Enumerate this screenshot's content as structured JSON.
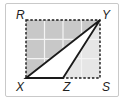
{
  "diagram": {
    "type": "geometry-figure",
    "points": {
      "R": {
        "label": "R",
        "x": 26,
        "y": 20
      },
      "Y": {
        "label": "Y",
        "x": 100,
        "y": 20
      },
      "S": {
        "label": "S",
        "x": 100,
        "y": 78
      },
      "X": {
        "label": "X",
        "x": 26,
        "y": 78
      },
      "Z": {
        "label": "Z",
        "x": 63,
        "y": 78
      }
    },
    "grid": {
      "columns": 4,
      "rows": 3
    },
    "rectangle": {
      "vertices": [
        "R",
        "Y",
        "S",
        "X"
      ],
      "style": "dashed"
    },
    "triangle": {
      "vertices": [
        "X",
        "Y",
        "Z"
      ],
      "fill": "white"
    },
    "colors": {
      "dark_shade": "#c8c8c8",
      "light_shade": "#e6e6e6",
      "grid_line": "#f4f4f4",
      "stroke": "#1a1a1a",
      "frame": "#c9c9c9"
    }
  }
}
